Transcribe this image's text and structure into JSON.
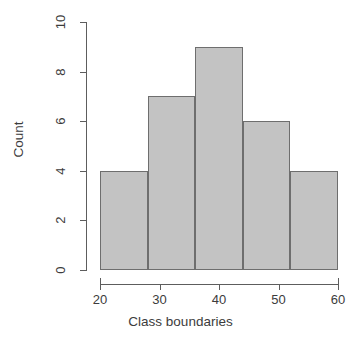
{
  "chart_data": {
    "type": "bar",
    "title": "",
    "subtitle": "",
    "xlabel": "Class boundaries",
    "ylabel": "Count",
    "categories": [
      "20-28",
      "28-36",
      "36-44",
      "44-52",
      "52-60"
    ],
    "bin_edges": [
      20,
      28,
      36,
      44,
      52,
      60
    ],
    "values": [
      4,
      7,
      9,
      6,
      4
    ],
    "xlim": [
      20,
      60
    ],
    "ylim": [
      0,
      10
    ],
    "x_ticks": [
      20,
      30,
      40,
      50,
      60
    ],
    "x_tick_labels": [
      "20",
      "30",
      "40",
      "50",
      "60"
    ],
    "y_ticks": [
      0,
      2,
      4,
      6,
      8,
      10
    ],
    "y_tick_labels": [
      "0",
      "2",
      "4",
      "6",
      "8",
      "10"
    ],
    "grid": false,
    "legend": false,
    "legend_position": "none",
    "bar_fill_color": "#c3c3c3",
    "bar_border_color": "#6e6e6e",
    "axis_color": "#5d5d5d",
    "background_color": "#ffffff",
    "text_color": "#3c3c3c"
  },
  "axes": {
    "x_title": "Class boundaries",
    "y_title": "Count"
  }
}
